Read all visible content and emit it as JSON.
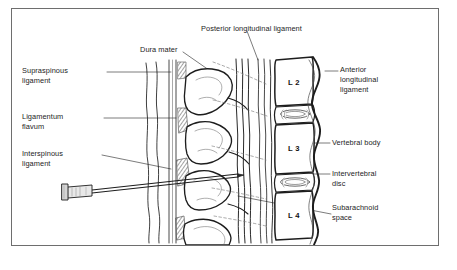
{
  "figure": {
    "type": "anatomical-line-diagram",
    "frame_color": "#6e6e6e",
    "background_color": "#ffffff",
    "line_color": "#1d1d1d"
  },
  "labels": {
    "posterior_longitudinal_ligament": "Posterior longitudinal ligament",
    "dura_mater": "Dura mater",
    "supraspinous_ligament_l1": "Supraspinous",
    "supraspinous_ligament_l2": "ligament",
    "ligamentum_flavum_l1": "Ligamentum",
    "ligamentum_flavum_l2": "flavum",
    "interspinous_ligament_l1": "Interspinous",
    "interspinous_ligament_l2": "ligament",
    "anterior_longitudinal_ligament_l1": "Anterior",
    "anterior_longitudinal_ligament_l2": "longitudinal",
    "anterior_longitudinal_ligament_l3": "ligament",
    "vertebral_body": "Vertebral body",
    "intervertebral_disc_l1": "Intervertebral",
    "intervertebral_disc_l2": "disc",
    "subarachnoid_space_l1": "Subarachnoid",
    "subarachnoid_space_l2": "space"
  },
  "vertebral_levels": [
    {
      "name": "L2",
      "label": "L 2"
    },
    {
      "name": "L3",
      "label": "L 3"
    },
    {
      "name": "L4",
      "label": "L 4"
    }
  ],
  "instrument": {
    "name": "spinal-needle",
    "description": "Spinal needle with hub entering interspinous space"
  }
}
